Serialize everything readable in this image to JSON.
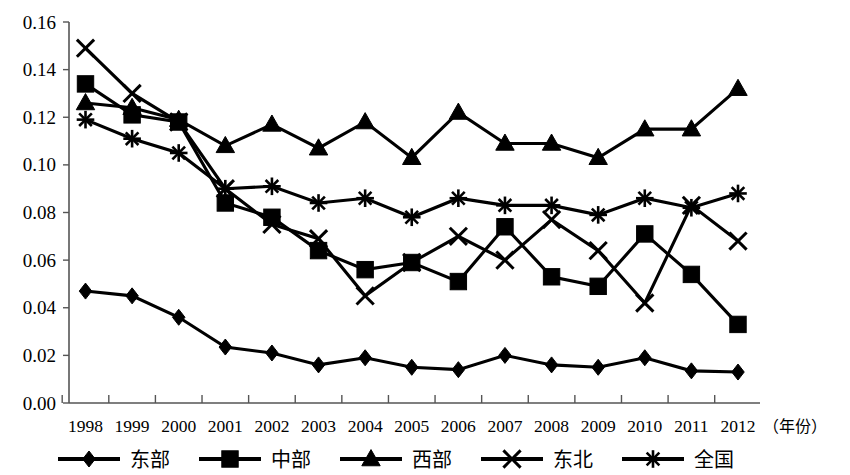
{
  "chart_data": {
    "type": "line",
    "title": "",
    "xlabel": "（年份）",
    "ylabel": "",
    "x": [
      1998,
      1999,
      2000,
      2001,
      2002,
      2003,
      2004,
      2005,
      2006,
      2007,
      2008,
      2009,
      2010,
      2011,
      2012
    ],
    "categories": [
      "1998",
      "1999",
      "2000",
      "2001",
      "2002",
      "2003",
      "2004",
      "2005",
      "2006",
      "2007",
      "2008",
      "2009",
      "2010",
      "2011",
      "2012"
    ],
    "ylim": [
      0.0,
      0.16
    ],
    "ytick_labels": [
      "0.00",
      "0.02",
      "0.04",
      "0.06",
      "0.08",
      "0.10",
      "0.12",
      "0.14",
      "0.16"
    ],
    "ytick_values": [
      0.0,
      0.02,
      0.04,
      0.06,
      0.08,
      0.1,
      0.12,
      0.14,
      0.16
    ],
    "grid": false,
    "legend_position": "bottom",
    "series": [
      {
        "name": "东部",
        "marker": "diamond",
        "values": [
          0.047,
          0.045,
          0.036,
          0.0235,
          0.021,
          0.016,
          0.019,
          0.015,
          0.014,
          0.02,
          0.016,
          0.015,
          0.019,
          0.0135,
          0.013
        ]
      },
      {
        "name": "中部",
        "marker": "square",
        "values": [
          0.134,
          0.121,
          0.118,
          0.084,
          0.078,
          0.064,
          0.056,
          0.059,
          0.051,
          0.074,
          0.053,
          0.049,
          0.071,
          0.054,
          0.033
        ]
      },
      {
        "name": "西部",
        "marker": "triangle",
        "values": [
          0.126,
          0.124,
          0.119,
          0.108,
          0.117,
          0.107,
          0.118,
          0.103,
          0.122,
          0.109,
          0.109,
          0.103,
          0.115,
          0.115,
          0.132
        ]
      },
      {
        "name": "东北",
        "marker": "x",
        "values": [
          0.149,
          0.13,
          0.118,
          0.09,
          0.075,
          0.069,
          0.045,
          0.059,
          0.07,
          0.06,
          0.077,
          0.064,
          0.042,
          0.083,
          0.068
        ]
      },
      {
        "name": "全国",
        "marker": "star",
        "values": [
          0.119,
          0.111,
          0.105,
          0.09,
          0.091,
          0.084,
          0.086,
          0.078,
          0.086,
          0.083,
          0.083,
          0.079,
          0.086,
          0.082,
          0.088
        ]
      }
    ]
  },
  "axis": {
    "year_note": "（年份）"
  },
  "legend": {
    "items": [
      {
        "label": "东部",
        "marker": "diamond"
      },
      {
        "label": "中部",
        "marker": "square"
      },
      {
        "label": "西部",
        "marker": "triangle"
      },
      {
        "label": "东北",
        "marker": "x"
      },
      {
        "label": "全国",
        "marker": "star"
      }
    ]
  }
}
